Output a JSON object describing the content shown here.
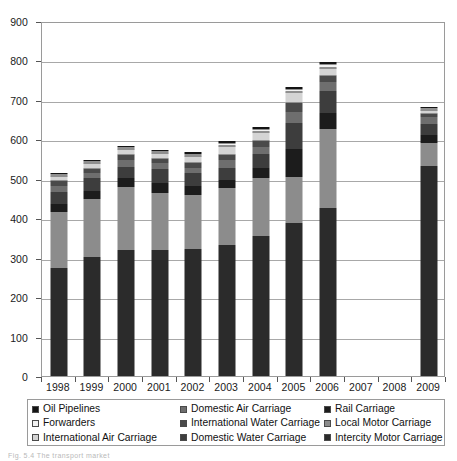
{
  "chart_data": {
    "type": "bar",
    "subtype": "stacked-column",
    "title": "",
    "xlabel": "",
    "ylabel": "",
    "ylim": [
      0,
      900
    ],
    "y_ticks": [
      0,
      100,
      200,
      300,
      400,
      500,
      600,
      700,
      800,
      900
    ],
    "grid": true,
    "legend_position": "bottom",
    "categories": [
      "1998",
      "1999",
      "2000",
      "2001",
      "2002",
      "2003",
      "2004",
      "2005",
      "2006",
      "2007",
      "2008",
      "2009"
    ],
    "series": [
      {
        "name": "Intercity Motor Carriage",
        "color": "#2b2b2b",
        "values": [
          274,
          302,
          320,
          320,
          323,
          333,
          355,
          388,
          427,
          null,
          null,
          532
        ]
      },
      {
        "name": "Local Motor Carriage",
        "color": "#8c8c8c",
        "values": [
          141,
          146,
          159,
          145,
          135,
          144,
          148,
          116,
          200,
          null,
          null,
          58
        ]
      },
      {
        "name": "Rail Carriage",
        "color": "#1c1c1c",
        "values": [
          22,
          20,
          22,
          25,
          24,
          19,
          24,
          72,
          41,
          null,
          null,
          22
        ]
      },
      {
        "name": "Domestic Water Carriage",
        "color": "#3d3d3d",
        "values": [
          30,
          34,
          30,
          35,
          33,
          32,
          37,
          65,
          54,
          null,
          null,
          27
        ]
      },
      {
        "name": "Domestic Air Carriage",
        "color": "#6e6e6e",
        "values": [
          16,
          14,
          17,
          14,
          13,
          19,
          16,
          28,
          24,
          null,
          null,
          18
        ]
      },
      {
        "name": "International Water Carriage",
        "color": "#4a4a4a",
        "values": [
          11,
          10,
          12,
          12,
          12,
          14,
          17,
          24,
          14,
          null,
          null,
          8
        ]
      },
      {
        "name": "International Air Carriage",
        "color": "#d4d4d4",
        "values": [
          13,
          14,
          16,
          14,
          17,
          22,
          21,
          27,
          22,
          null,
          null,
          9
        ]
      },
      {
        "name": "Forwarders",
        "color": "#f2f2f2",
        "values": [
          5,
          5,
          6,
          6,
          7,
          8,
          8,
          7,
          10,
          null,
          null,
          5
        ]
      },
      {
        "name": "Oil Pipelines",
        "color": "#141414",
        "values": [
          2,
          3,
          2,
          3,
          4,
          4,
          5,
          5,
          3,
          null,
          null,
          2
        ]
      }
    ],
    "totals": [
      514,
      548,
      584,
      574,
      568,
      595,
      631,
      732,
      795,
      null,
      null,
      681
    ],
    "legend_entries": [
      {
        "label": "Oil Pipelines",
        "color": "#141414"
      },
      {
        "label": "Domestic Air Carriage",
        "color": "#6e6e6e"
      },
      {
        "label": "Rail Carriage",
        "color": "#1c1c1c"
      },
      {
        "label": "Forwarders",
        "color": "#f2f2f2"
      },
      {
        "label": "International Water Carriage",
        "color": "#4a4a4a"
      },
      {
        "label": "Local Motor Carriage",
        "color": "#8c8c8c"
      },
      {
        "label": "International Air Carriage",
        "color": "#d4d4d4"
      },
      {
        "label": "Domestic Water Carriage",
        "color": "#3d3d3d"
      },
      {
        "label": "Intercity Motor Carriage",
        "color": "#2b2b2b"
      }
    ]
  },
  "caption": {
    "text": "Fig. 5.4  The transport market"
  },
  "colors": {
    "axis": "#9a9a9a",
    "grid": "#a8a8a8",
    "text": "#1a1a1a",
    "background": "#ffffff"
  }
}
